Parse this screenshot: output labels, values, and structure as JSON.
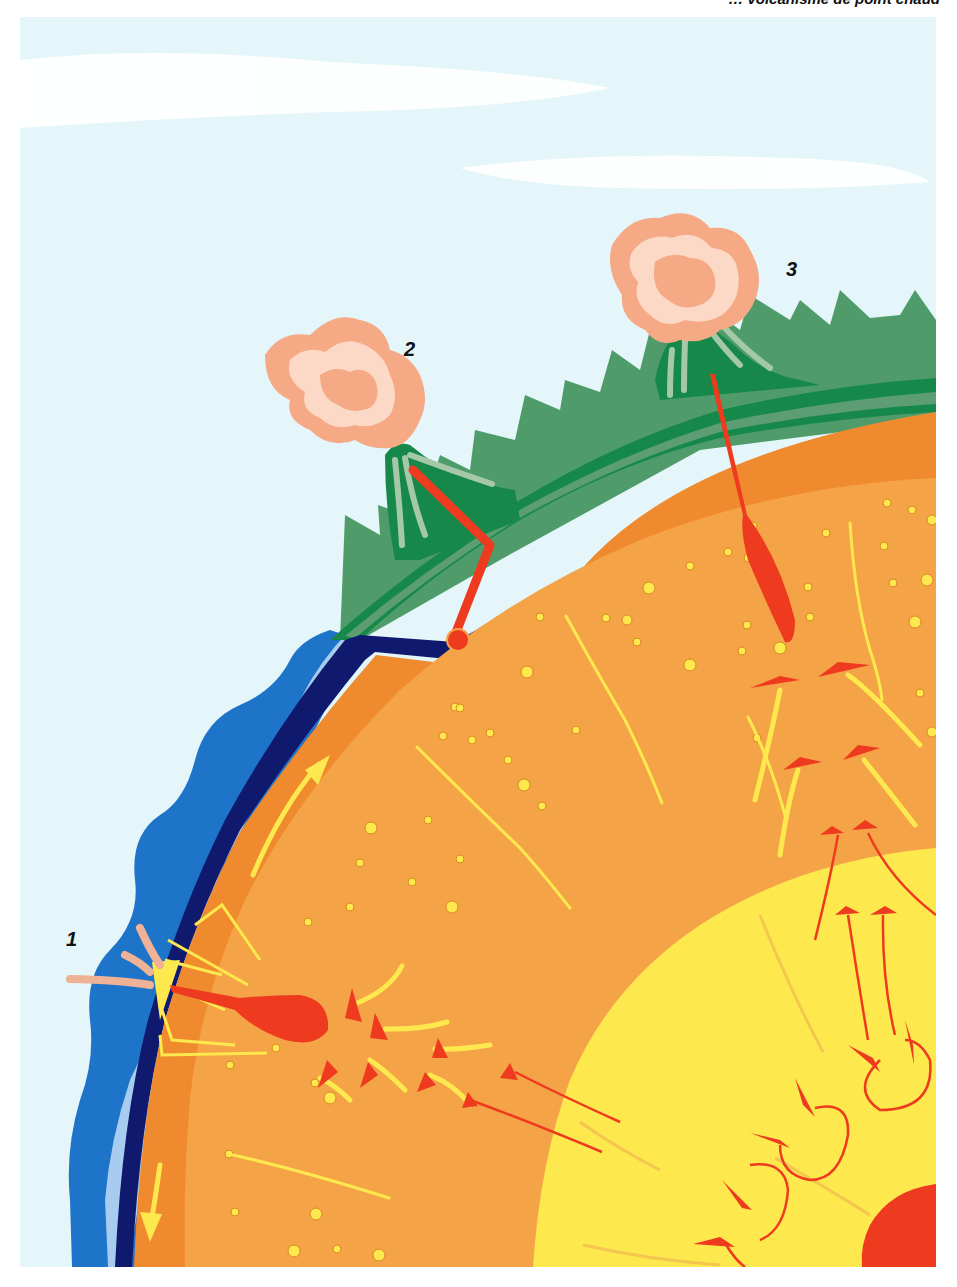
{
  "caption": {
    "text": "… volcanisme de point chaud"
  },
  "labels": [
    {
      "id": "1",
      "text": "1",
      "x": 66,
      "y": 928,
      "meaning": "subduction-trench-volcano"
    },
    {
      "id": "2",
      "text": "2",
      "x": 404,
      "y": 338,
      "meaning": "subduction-arc-volcano"
    },
    {
      "id": "3",
      "text": "3",
      "x": 786,
      "y": 258,
      "meaning": "hotspot-volcano"
    }
  ],
  "colors": {
    "sky": "#e4f6fa",
    "cloud": "#ffffff",
    "ocean_dark": "#1e74c8",
    "ocean_light": "#a8ccef",
    "plate_navy": "#0f1a6e",
    "lithosphere_dark_green": "#16894a",
    "lithosphere_light_green": "#5d9d74",
    "mountain_green": "#4f9c6a",
    "upper_mantle": "#f08a2e",
    "lower_mantle": "#f5a347",
    "outer_core": "#fde84e",
    "inner_core": "#ee3a1e",
    "magma_red": "#ee3a1e",
    "flow_yellow": "#fbe555",
    "ash_outer": "#f6a985",
    "ash_inner": "#fbd9c6",
    "label_text": "#111111"
  },
  "layers": [
    "sky",
    "ocean",
    "oceanic-crust",
    "continental-lithosphere",
    "upper-mantle",
    "lower-mantle",
    "outer-core",
    "inner-core"
  ]
}
